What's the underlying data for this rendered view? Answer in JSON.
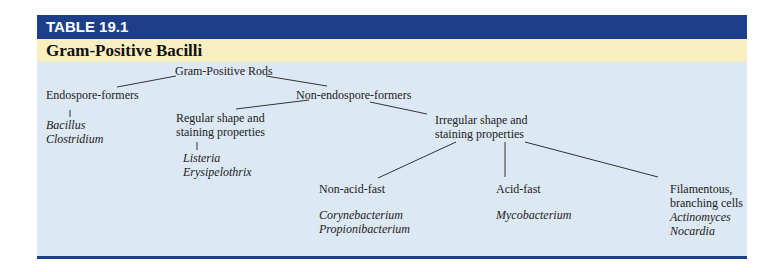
{
  "table": {
    "label": "TABLE 19.1",
    "title": "Gram-Positive Bacilli",
    "colors": {
      "header": "#1d3f8a",
      "title_band": "#f7efc0",
      "body": "#dce8f3"
    }
  },
  "tree": {
    "root": "Gram-Positive Rods",
    "endospore": {
      "label": "Endospore-formers",
      "genera": [
        "Bacillus",
        "Clostridium"
      ]
    },
    "non_endospore": {
      "label": "Non-endospore-formers"
    },
    "regular": {
      "line1": "Regular shape and",
      "line2": "staining properties",
      "genera": [
        "Listeria",
        "Erysipelothrix"
      ]
    },
    "irregular": {
      "line1": "Irregular shape and",
      "line2": "staining properties"
    },
    "non_acid_fast": {
      "label": "Non-acid-fast",
      "genera": [
        "Corynebacterium",
        "Propionibacterium"
      ]
    },
    "acid_fast": {
      "label": "Acid-fast",
      "genera": [
        "Mycobacterium"
      ]
    },
    "filamentous": {
      "line1": "Filamentous,",
      "line2": "branching cells",
      "genera": [
        "Actinomyces",
        "Nocardia"
      ]
    }
  }
}
